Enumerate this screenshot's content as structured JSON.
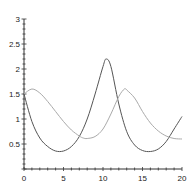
{
  "chart_data": {
    "type": "line",
    "title": "",
    "xlabel": "",
    "ylabel": "",
    "xlim": [
      0,
      20
    ],
    "ylim": [
      0,
      3
    ],
    "grid": false,
    "legend": null,
    "x_ticks": [
      "0",
      "5",
      "10",
      "15",
      "20"
    ],
    "y_ticks": [
      "0.5",
      "1",
      "1.5",
      "2",
      "2.5",
      "3"
    ],
    "origin_label": "0",
    "series": [
      {
        "name": "dark curve",
        "color": "#555555",
        "x": [
          0,
          1,
          2,
          3,
          4,
          5,
          6,
          7,
          8,
          9,
          10,
          10.4,
          11,
          12,
          13,
          14,
          15,
          16,
          17,
          18,
          19,
          20
        ],
        "y": [
          1.5,
          0.95,
          0.62,
          0.45,
          0.36,
          0.36,
          0.45,
          0.65,
          1.0,
          1.5,
          2.05,
          2.2,
          2.05,
          1.3,
          0.75,
          0.48,
          0.37,
          0.35,
          0.4,
          0.55,
          0.8,
          1.05
        ]
      },
      {
        "name": "light curve",
        "color": "#aaaaaa",
        "x": [
          0,
          1,
          2,
          3,
          4,
          5,
          6,
          7,
          7.5,
          8,
          9,
          10,
          11,
          12,
          12.7,
          13,
          14,
          15,
          16,
          17,
          18,
          19,
          20
        ],
        "y": [
          1.5,
          1.6,
          1.52,
          1.35,
          1.15,
          0.95,
          0.78,
          0.66,
          0.62,
          0.61,
          0.65,
          0.8,
          1.1,
          1.45,
          1.6,
          1.58,
          1.42,
          1.15,
          0.92,
          0.76,
          0.66,
          0.61,
          0.6
        ]
      }
    ]
  }
}
